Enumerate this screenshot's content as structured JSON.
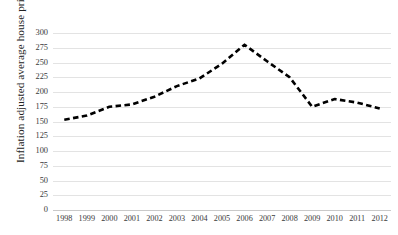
{
  "chart_data": {
    "type": "line",
    "title": "",
    "xlabel": "",
    "ylabel": "Inflation adjusted average house prices in 000 dollars",
    "categories": [
      "1998",
      "1999",
      "2000",
      "2001",
      "2002",
      "2003",
      "2004",
      "2005",
      "2006",
      "2007",
      "2008",
      "2009",
      "2010",
      "2011",
      "2012"
    ],
    "values": [
      153,
      160,
      175,
      179,
      192,
      210,
      223,
      248,
      280,
      252,
      225,
      175,
      188,
      182,
      172
    ],
    "series": [
      {
        "name": "Inflation adjusted average house prices",
        "values": [
          153,
          160,
          175,
          179,
          192,
          210,
          223,
          248,
          280,
          252,
          225,
          175,
          188,
          182,
          172
        ]
      }
    ],
    "ylim": [
      0,
      300
    ],
    "yticks": [
      0,
      25,
      50,
      75,
      100,
      125,
      150,
      175,
      200,
      225,
      250,
      275,
      300
    ],
    "ytick_labels": [
      "0",
      "25",
      "50",
      "75",
      "100",
      "125",
      "150",
      "175",
      "200",
      "225",
      "250",
      "275",
      "300"
    ],
    "xtick_labels": [
      "1998",
      "1999",
      "2000",
      "2001",
      "2002",
      "2003",
      "2004",
      "2005",
      "2006",
      "2007",
      "2008",
      "2009",
      "2010",
      "2011",
      "2012"
    ],
    "grid": true,
    "legend": "none",
    "line_style": "dashed",
    "line_color": "#000000",
    "grid_color": "#e3e3e3",
    "background_color": "#ffffff"
  }
}
